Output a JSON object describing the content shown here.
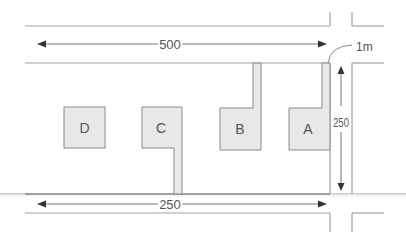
{
  "diagram": {
    "type": "site-plan",
    "colors": {
      "road_line": "#9a9a9a",
      "arrow": "#444444",
      "building_fill": "#e8e8e8",
      "building_stroke": "#8a8a8a",
      "text": "#555555"
    },
    "dimensions": {
      "top_horizontal": "500",
      "bottom_horizontal": "250",
      "vertical": "250",
      "corner_radius": "1m"
    },
    "buildings": [
      {
        "id": "D",
        "label": "D",
        "driveway": "none"
      },
      {
        "id": "C",
        "label": "C",
        "driveway": "to bottom road"
      },
      {
        "id": "B",
        "label": "B",
        "driveway": "to top road"
      },
      {
        "id": "A",
        "label": "A",
        "driveway": "to top road, at corner"
      }
    ]
  }
}
